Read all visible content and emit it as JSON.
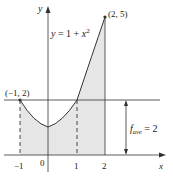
{
  "figure": {
    "curve_label": "y = 1 + x",
    "curve_label_exp": "2",
    "point_left": "(−1, 2)",
    "point_right": "(2, 5)",
    "y_axis_label": "y",
    "x_axis_label": "x",
    "favg_label_f": "f",
    "favg_label_sub": "ave",
    "favg_label_rest": " = 2",
    "x_ticks": [
      "−1",
      "0",
      "1",
      "2"
    ]
  },
  "colors": {
    "shade": "#e6e6e6",
    "stroke": "#333333"
  }
}
